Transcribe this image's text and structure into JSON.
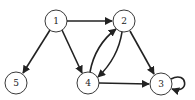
{
  "graph": {
    "type": "directed",
    "nodes": [
      {
        "id": "1",
        "label": "1",
        "x": 56,
        "y": 21
      },
      {
        "id": "2",
        "label": "2",
        "x": 124,
        "y": 21
      },
      {
        "id": "3",
        "label": "3",
        "x": 161,
        "y": 84
      },
      {
        "id": "4",
        "label": "4",
        "x": 88,
        "y": 83
      },
      {
        "id": "5",
        "label": "5",
        "x": 16,
        "y": 83
      }
    ],
    "edges": [
      {
        "from": "1",
        "to": "2"
      },
      {
        "from": "1",
        "to": "5"
      },
      {
        "from": "1",
        "to": "4"
      },
      {
        "from": "4",
        "to": "2"
      },
      {
        "from": "2",
        "to": "4"
      },
      {
        "from": "2",
        "to": "3"
      },
      {
        "from": "4",
        "to": "3"
      },
      {
        "from": "3",
        "to": "3"
      }
    ],
    "colors": {
      "stroke": "#222222",
      "fill": "#ffffff"
    }
  }
}
